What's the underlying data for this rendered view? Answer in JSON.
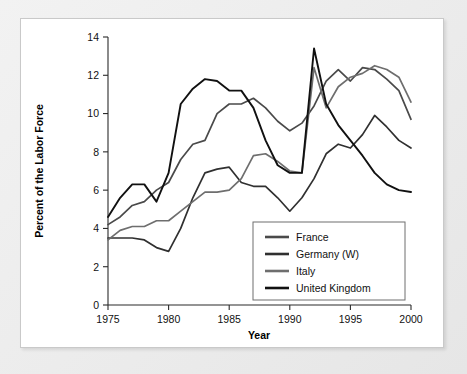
{
  "chart_data": {
    "type": "line",
    "title": "",
    "xlabel": "Year",
    "ylabel": "Percent of the Labor Force",
    "xlim": [
      1975,
      2000
    ],
    "ylim": [
      0,
      14
    ],
    "xticks": [
      1975,
      1980,
      1985,
      1990,
      1995,
      2000
    ],
    "yticks": [
      0,
      2,
      4,
      6,
      8,
      10,
      12,
      14
    ],
    "grid": false,
    "legend_position": "lower-right-inside",
    "x": [
      1975,
      1976,
      1977,
      1978,
      1979,
      1980,
      1981,
      1982,
      1983,
      1984,
      1985,
      1986,
      1987,
      1988,
      1989,
      1990,
      1991,
      1992,
      1993,
      1994,
      1995,
      1996,
      1997,
      1998,
      1999,
      2000
    ],
    "series": [
      {
        "name": "France",
        "color": "#4a4a4a",
        "values": [
          4.2,
          4.6,
          5.2,
          5.4,
          6.0,
          6.4,
          7.6,
          8.4,
          8.6,
          10.0,
          10.5,
          10.5,
          10.8,
          10.3,
          9.6,
          9.1,
          9.5,
          10.4,
          11.7,
          12.3,
          11.7,
          12.4,
          12.3,
          11.8,
          11.2,
          9.7
        ]
      },
      {
        "name": "Germany (W)",
        "color": "#303030",
        "values": [
          3.5,
          3.5,
          3.5,
          3.4,
          3.0,
          2.8,
          4.0,
          5.6,
          6.9,
          7.1,
          7.2,
          6.4,
          6.2,
          6.2,
          5.6,
          4.9,
          5.6,
          6.6,
          7.9,
          8.4,
          8.2,
          8.9,
          9.9,
          9.3,
          8.6,
          8.2
        ]
      },
      {
        "name": "Italy",
        "color": "#6e6e6e",
        "values": [
          3.4,
          3.9,
          4.1,
          4.1,
          4.4,
          4.4,
          4.9,
          5.4,
          5.9,
          5.9,
          6.0,
          6.6,
          7.8,
          7.9,
          7.5,
          7.0,
          6.9,
          12.4,
          10.3,
          11.4,
          11.9,
          12.1,
          12.5,
          12.3,
          11.9,
          10.6
        ]
      },
      {
        "name": "United Kingdom",
        "color": "#111111",
        "values": [
          4.6,
          5.6,
          6.3,
          6.3,
          5.4,
          6.9,
          10.5,
          11.3,
          11.8,
          11.7,
          11.2,
          11.2,
          10.3,
          8.6,
          7.3,
          6.9,
          6.9,
          13.4,
          10.5,
          9.4,
          8.6,
          7.8,
          6.9,
          6.3,
          6.0,
          5.9
        ]
      }
    ],
    "legend_entries": [
      "France",
      "Germany (W)",
      "Italy",
      "United Kingdom"
    ]
  }
}
